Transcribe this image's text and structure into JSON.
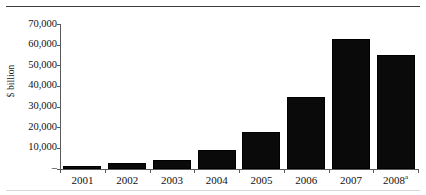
{
  "figure": {
    "axis_title_y": "$ billion",
    "zero_tick_label": "–",
    "note_marker": "a"
  },
  "chart_data": {
    "type": "bar",
    "title": "",
    "subtitle": "",
    "xlabel": "",
    "ylabel": "$ billion",
    "categories": [
      "2001",
      "2002",
      "2003",
      "2004",
      "2005",
      "2006",
      "2007",
      "2008"
    ],
    "category_labels_display": [
      "2001",
      "2002",
      "2003",
      "2004",
      "2005",
      "2006",
      "2007",
      "2008ᵃ"
    ],
    "values": [
      1500,
      2800,
      4500,
      9000,
      18000,
      35000,
      63000,
      55000
    ],
    "series": [
      {
        "name": "$ billion",
        "values": [
          1500,
          2800,
          4500,
          9000,
          18000,
          35000,
          63000,
          55000
        ]
      }
    ],
    "ylim": [
      0,
      70000
    ],
    "yticks": [
      0,
      10000,
      20000,
      30000,
      40000,
      50000,
      60000,
      70000
    ],
    "ytick_labels": [
      "–",
      "10,000",
      "20,000",
      "30,000",
      "40,000",
      "50,000",
      "60,000",
      "70,000"
    ],
    "grid": false,
    "legend": null,
    "legend_position": "none",
    "bar_color": "#0a0a0a",
    "annotations": [
      "2008 bar is labelled with superscript note marker a"
    ]
  },
  "y_ticks": [
    {
      "label": "70,000",
      "value": 70000
    },
    {
      "label": "60,000",
      "value": 60000
    },
    {
      "label": "50,000",
      "value": 50000
    },
    {
      "label": "40,000",
      "value": 40000
    },
    {
      "label": "30,000",
      "value": 30000
    },
    {
      "label": "20,000",
      "value": 20000
    },
    {
      "label": "10,000",
      "value": 10000
    },
    {
      "label": "–",
      "value": 0
    }
  ],
  "bars": [
    {
      "label": "2001",
      "value": 1500
    },
    {
      "label": "2002",
      "value": 2800
    },
    {
      "label": "2003",
      "value": 4500
    },
    {
      "label": "2004",
      "value": 9000
    },
    {
      "label": "2005",
      "value": 18000
    },
    {
      "label": "2006",
      "value": 35000
    },
    {
      "label": "2007",
      "value": 63000
    },
    {
      "label": "2008",
      "value": 55000
    }
  ],
  "colors": {
    "bar": "#0a0a0a",
    "axis": "#5a5a5a",
    "rule": "#3c3c3c",
    "text": "#111111",
    "background": "#ffffff"
  }
}
